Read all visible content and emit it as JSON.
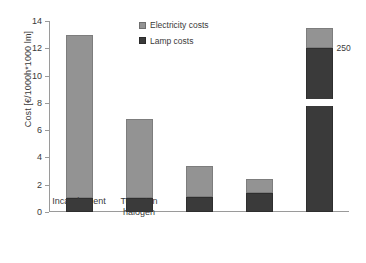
{
  "chart_data": {
    "type": "bar",
    "title": "",
    "xlabel": "",
    "ylabel": "Cost [€/1000h*1000 lm]",
    "ylim": [
      0,
      14
    ],
    "yticks": [
      0,
      2,
      4,
      6,
      8,
      10,
      12,
      14
    ],
    "ytick_labels": [
      "0",
      "2",
      "4",
      "6",
      "8",
      "10",
      "12",
      "14"
    ],
    "grid": false,
    "stacked": true,
    "legend_position": "top-center",
    "categories": [
      "Incandescent",
      "Tungsten halogen",
      "CFL",
      "LED",
      "OLED"
    ],
    "category_lines": [
      [
        "Incandescent"
      ],
      [
        "Tungsten",
        "halogen"
      ],
      [
        "CFL"
      ],
      [
        "LED"
      ],
      [
        "OLED"
      ]
    ],
    "series": [
      {
        "name": "Lamp costs",
        "color": "#3a3a3a",
        "values": [
          1.0,
          1.0,
          1.1,
          1.4,
          12.0
        ]
      },
      {
        "name": "Electricity costs",
        "color": "#939393",
        "values": [
          12.0,
          5.8,
          2.3,
          1.0,
          1.5
        ]
      }
    ],
    "totals": [
      13.0,
      6.8,
      3.4,
      2.4,
      13.5
    ],
    "annotations": [
      {
        "text": "250",
        "category": "OLED",
        "value": 12.0,
        "note": "label at boundary between lamp-cost and electricity-cost segments of OLED bar"
      }
    ],
    "axis_break": {
      "present": true,
      "category": "OLED",
      "from": 7.8,
      "to": 8.3,
      "note": "white gap across the OLED bar indicating a broken value axis"
    }
  },
  "legend": {
    "items": [
      {
        "label": "Electricity costs",
        "swatch": "light-gray-swatch"
      },
      {
        "label": "Lamp costs",
        "swatch": "dark-gray-swatch"
      }
    ]
  },
  "colors": {
    "electricity": "#939393",
    "lamp": "#3a3a3a",
    "axis": "#9a9a9a",
    "text": "#3a3a3a",
    "background": "#ffffff"
  }
}
